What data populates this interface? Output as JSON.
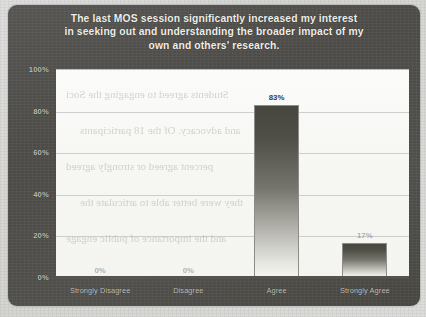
{
  "chart_data": {
    "type": "bar",
    "title": "The last MOS session significantly increased my interest in seeking out and understanding the broader impact of my own and others' research.",
    "title_lines": [
      "The last MOS session significantly increased my interest",
      "in seeking out and understanding the broader impact of my",
      "own and others' research."
    ],
    "categories": [
      "Strongly Disagree",
      "Disagree",
      "Agree",
      "Strongly Agree"
    ],
    "values": [
      0,
      0,
      83,
      17
    ],
    "value_labels": [
      "0%",
      "0%",
      "83%",
      "17%"
    ],
    "xlabel": "",
    "ylabel": "",
    "ylim": [
      0,
      100
    ],
    "ytick_values": [
      0,
      20,
      40,
      60,
      80,
      100
    ],
    "ytick_labels": [
      "0%",
      "20%",
      "40%",
      "60%",
      "80%",
      "100%"
    ],
    "grid": true,
    "legend": false,
    "units": "percent"
  },
  "style": {
    "panel_background": "#4c4b48",
    "plot_background": "#f6f6f3",
    "title_color": "#f0efe9",
    "axis_label_color": "#c2c1bb",
    "bar_color_top": "#47463f",
    "bar_color_bottom": "#f4f4f0",
    "gridline_color": "#969694"
  },
  "ghost_text": [
    "Students agreed to engaging the Soci",
    "and advocacy. Of the 18 participants",
    "percent agreed or strongly agreed",
    "they were better able to articulate the",
    "and the importance of public engage"
  ]
}
